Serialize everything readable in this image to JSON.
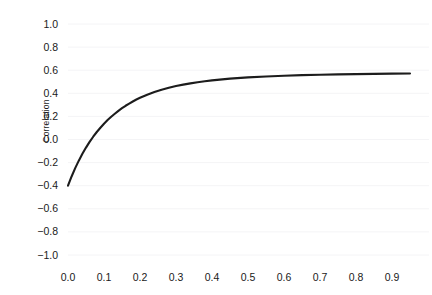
{
  "chart_data": {
    "type": "line",
    "title": "",
    "subtitle": "",
    "xlabel": "",
    "ylabel": "Correlation",
    "xlim": [
      -0.01,
      0.96
    ],
    "ylim": [
      -1.0,
      1.0
    ],
    "grid": true,
    "grid_axis": "y",
    "legend": false,
    "legend_position": "none",
    "line_color": "#1c1c1c",
    "grid_color": "#f4f4f6",
    "background_color": "#ffffff",
    "x_ticks": [
      0.0,
      0.1,
      0.2,
      0.3,
      0.4,
      0.5,
      0.6,
      0.7,
      0.8,
      0.9
    ],
    "x_tick_labels": [
      "0.0",
      "0.1",
      "0.2",
      "0.3",
      "0.4",
      "0.5",
      "0.6",
      "0.7",
      "0.8",
      "0.9"
    ],
    "y_ticks": [
      -1.0,
      -0.8,
      -0.6,
      -0.4,
      -0.2,
      0.0,
      0.2,
      0.4,
      0.6,
      0.8,
      1.0
    ],
    "y_tick_labels": [
      "-1.0",
      "-0.8",
      "-0.6",
      "-0.4",
      "-0.2",
      "0.0",
      "0.2",
      "0.4",
      "0.6",
      "0.8",
      "1.0"
    ],
    "series": [
      {
        "name": "Correlation",
        "x": [
          0.0,
          0.01,
          0.02,
          0.03,
          0.04,
          0.05,
          0.06,
          0.07,
          0.08,
          0.09,
          0.1,
          0.11,
          0.12,
          0.13,
          0.14,
          0.15,
          0.16,
          0.17,
          0.18,
          0.19,
          0.2,
          0.22,
          0.24,
          0.26,
          0.28,
          0.3,
          0.32,
          0.34,
          0.36,
          0.38,
          0.4,
          0.45,
          0.5,
          0.55,
          0.6,
          0.65,
          0.7,
          0.75,
          0.8,
          0.85,
          0.9,
          0.95
        ],
        "y": [
          -0.4,
          -0.32,
          -0.248,
          -0.183,
          -0.124,
          -0.07,
          -0.021,
          0.024,
          0.065,
          0.102,
          0.136,
          0.168,
          0.197,
          0.223,
          0.248,
          0.271,
          0.292,
          0.311,
          0.329,
          0.346,
          0.361,
          0.388,
          0.411,
          0.431,
          0.448,
          0.463,
          0.475,
          0.486,
          0.496,
          0.504,
          0.512,
          0.527,
          0.538,
          0.546,
          0.552,
          0.557,
          0.561,
          0.564,
          0.566,
          0.568,
          0.57,
          0.571
        ]
      }
    ],
    "annotations": [
      {
        "text": "starts at -0.40 at x = 0.0",
        "x": 0.0,
        "y": -0.4
      },
      {
        "text": "asymptote near 0.57",
        "x": 0.95,
        "y": 0.57
      }
    ]
  },
  "axes": {
    "y_title": "Correlation"
  }
}
